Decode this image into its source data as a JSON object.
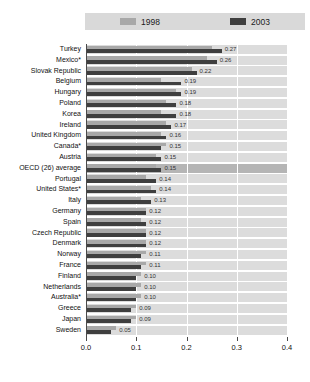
{
  "chart_data": {
    "type": "bar",
    "orientation": "horizontal",
    "title": "",
    "legend": {
      "position": "top",
      "items": [
        {
          "label": "1998",
          "color": "#a8a8a8"
        },
        {
          "label": "2003",
          "color": "#3f3f3f"
        }
      ]
    },
    "categories": [
      "Turkey",
      "Mexico*",
      "Slovak Republic",
      "Belgium",
      "Hungary",
      "Poland",
      "Korea",
      "Ireland",
      "United Kingdom",
      "Canada*",
      "Austria",
      "OECD (26) average",
      "Portugal",
      "United States*",
      "Italy",
      "Germany",
      "Spain",
      "Czech Republic",
      "Denmark",
      "Norway",
      "France",
      "Finland",
      "Netherlands",
      "Australia*",
      "Greece",
      "Japan",
      "Sweden"
    ],
    "series": [
      {
        "name": "1998",
        "values": [
          0.25,
          0.24,
          0.21,
          0.15,
          0.18,
          0.16,
          0.15,
          0.16,
          0.15,
          0.16,
          0.14,
          0.14,
          0.12,
          0.13,
          0.11,
          0.12,
          0.11,
          0.12,
          0.12,
          0.12,
          0.12,
          0.11,
          0.11,
          0.11,
          0.1,
          0.1,
          0.06
        ]
      },
      {
        "name": "2003",
        "values": [
          0.27,
          0.26,
          0.22,
          0.19,
          0.19,
          0.18,
          0.18,
          0.17,
          0.16,
          0.15,
          0.15,
          0.15,
          0.14,
          0.14,
          0.13,
          0.12,
          0.12,
          0.12,
          0.12,
          0.11,
          0.11,
          0.1,
          0.1,
          0.1,
          0.09,
          0.09,
          0.05
        ]
      }
    ],
    "value_labels": [
      "0.27",
      "0.26",
      "0.22",
      "0.19",
      "0.19",
      "0.18",
      "0.18",
      "0.17",
      "0.16",
      "0.15",
      "0.15",
      "0.15",
      "0.14",
      "0.14",
      "0.13",
      "0.12",
      "0.12",
      "0.12",
      "0.12",
      "0.11",
      "0.11",
      "0.10",
      "0.10",
      "0.10",
      "0.09",
      "0.09",
      "0.05"
    ],
    "xlim": [
      0,
      0.4
    ],
    "xticks": [
      "0.0",
      "0.1",
      "0.2",
      "0.3",
      "0.4"
    ],
    "grid": "vertical-white-lines",
    "highlight_category": "OECD (26) average",
    "colors": {
      "row_band": "#dcdcdc",
      "row_band_highlight": "#b5b5b5",
      "bar_1998": "#a8a8a8",
      "bar_2003": "#3f3f3f",
      "legend_band": "#d9d9d9",
      "gridline": "#ffffff"
    }
  }
}
